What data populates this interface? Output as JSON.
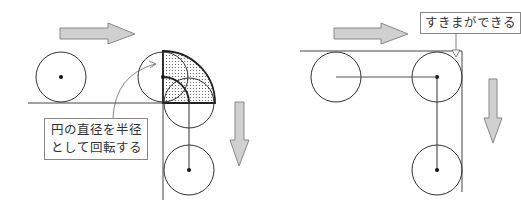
{
  "left_diagram": {
    "caption": "円の直径を半径として回転する",
    "caption_lines": [
      "円の直径を半径",
      "として回転する"
    ],
    "arrow_right": "motion-right",
    "arrow_down": "motion-down"
  },
  "right_diagram": {
    "caption": "すきまができる"
  },
  "colors": {
    "stroke": "#333333",
    "arrow_fill": "#cccccc",
    "arrow_stroke": "#888888",
    "shade_dots": "#555555"
  }
}
